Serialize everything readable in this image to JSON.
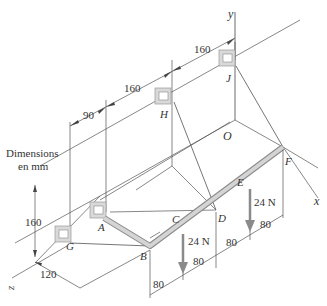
{
  "diagram": {
    "title_note": [
      "Dimensions",
      "en mm"
    ],
    "axes": {
      "x": "x",
      "y": "y",
      "z": "z",
      "origin": "O"
    },
    "points": {
      "A": "A",
      "B": "B",
      "C": "C",
      "D": "D",
      "E": "E",
      "F": "F",
      "G": "G",
      "H": "H",
      "J": "J"
    },
    "dimensions": {
      "top_left": "90",
      "top_mid": "160",
      "top_right": "160",
      "height": "160",
      "depth": "120",
      "bottom": [
        "80",
        "80",
        "80",
        "80"
      ]
    },
    "loads": [
      {
        "label": "24 N",
        "at": "C"
      },
      {
        "label": "24 N",
        "at": "E"
      }
    ],
    "colors": {
      "rod": "#c8c8c8",
      "rod_edge": "#8a8a8a",
      "bracket": "#d9d9d9",
      "arrow": "#8a8a8a",
      "line": "#444444"
    }
  }
}
